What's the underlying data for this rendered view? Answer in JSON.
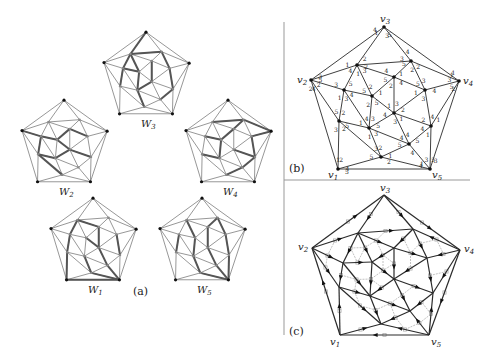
{
  "figure": {
    "panel_a": {
      "caption": "(a)",
      "graphs": [
        {
          "id": "W3",
          "label": "W",
          "sub": "3",
          "cx": 146,
          "cy": 81,
          "highlight": [
            [
              "v3",
              "a"
            ],
            [
              "a",
              "c"
            ],
            [
              "c",
              "h"
            ],
            [
              "a",
              "b"
            ],
            [
              "b",
              "e"
            ],
            [
              "e",
              "i"
            ],
            [
              "i",
              "k"
            ],
            [
              "c",
              "f"
            ],
            [
              "f",
              "j"
            ],
            [
              "a",
              "f"
            ],
            [
              "d",
              "g"
            ],
            [
              "g",
              "j"
            ],
            [
              "j",
              "l"
            ]
          ]
        },
        {
          "id": "W2",
          "label": "W",
          "sub": "2",
          "cx": 64,
          "cy": 149,
          "highlight": [
            [
              "v2",
              "c"
            ],
            [
              "c",
              "f"
            ],
            [
              "f",
              "d"
            ],
            [
              "d",
              "e"
            ],
            [
              "h",
              "j"
            ],
            [
              "j",
              "g"
            ],
            [
              "g",
              "i"
            ],
            [
              "c",
              "h"
            ],
            [
              "f",
              "g"
            ],
            [
              "h",
              "l"
            ]
          ]
        },
        {
          "id": "W4",
          "label": "W",
          "sub": "4",
          "cx": 228,
          "cy": 149,
          "highlight": [
            [
              "a",
              "b"
            ],
            [
              "b",
              "v4"
            ],
            [
              "v4",
              "e"
            ],
            [
              "e",
              "i"
            ],
            [
              "i",
              "k"
            ],
            [
              "k",
              "l"
            ],
            [
              "c",
              "f"
            ],
            [
              "f",
              "j"
            ],
            [
              "j",
              "h"
            ],
            [
              "f",
              "d"
            ],
            [
              "d",
              "b"
            ],
            [
              "g",
              "i"
            ]
          ]
        },
        {
          "id": "W1",
          "label": "W",
          "sub": "1",
          "cx": 93,
          "cy": 247,
          "highlight": [
            [
              "v1",
              "v5"
            ],
            [
              "v1",
              "h"
            ],
            [
              "h",
              "c"
            ],
            [
              "c",
              "a"
            ],
            [
              "a",
              "d"
            ],
            [
              "d",
              "g"
            ],
            [
              "g",
              "k"
            ],
            [
              "k",
              "v5"
            ],
            [
              "f",
              "g"
            ],
            [
              "j",
              "l"
            ],
            [
              "l",
              "v5"
            ],
            [
              "e",
              "i"
            ]
          ]
        },
        {
          "id": "W5",
          "label": "W",
          "sub": "5",
          "cx": 202,
          "cy": 247,
          "highlight": [
            [
              "v5",
              "l"
            ],
            [
              "l",
              "j"
            ],
            [
              "j",
              "f"
            ],
            [
              "f",
              "a"
            ],
            [
              "v5",
              "k"
            ],
            [
              "k",
              "g"
            ],
            [
              "g",
              "d"
            ],
            [
              "d",
              "b"
            ],
            [
              "v5",
              "i"
            ],
            [
              "i",
              "e"
            ],
            [
              "e",
              "b"
            ],
            [
              "h",
              "c"
            ]
          ]
        }
      ]
    },
    "panel_b": {
      "caption": "(b)",
      "vertex_labels": {
        "v1": "v1",
        "v2": "v2",
        "v3": "v3",
        "v4": "v4",
        "v5": "v5"
      },
      "edge_label_values": [
        "1",
        "2",
        "3",
        "4",
        "5"
      ]
    },
    "panel_c": {
      "caption": "(c)",
      "vertex_labels": {
        "v1": "v1",
        "v2": "v2",
        "v3": "v3",
        "v4": "v4",
        "v5": "v5"
      }
    },
    "graph": {
      "vertices_b": {
        "v1": [
          338,
          169
        ],
        "v2": [
          311,
          80
        ],
        "v3": [
          384,
          27
        ],
        "v4": [
          459,
          81
        ],
        "v5": [
          430,
          169
        ],
        "a": [
          357,
          65
        ],
        "b": [
          411,
          61
        ],
        "c": [
          344,
          90
        ],
        "d": [
          394,
          77
        ],
        "e": [
          425,
          90
        ],
        "f": [
          372,
          96
        ],
        "g": [
          394,
          113
        ],
        "h": [
          339,
          121
        ],
        "i": [
          431,
          126
        ],
        "j": [
          369,
          128
        ],
        "k": [
          409,
          144
        ],
        "l": [
          381,
          157
        ]
      },
      "vertices_c": {
        "v1": [
          340,
          335
        ],
        "v2": [
          312,
          248
        ],
        "v3": [
          384,
          195
        ],
        "v4": [
          460,
          250
        ],
        "v5": [
          429,
          335
        ],
        "a": [
          358,
          233
        ],
        "b": [
          413,
          229
        ],
        "c": [
          343,
          263
        ],
        "d": [
          394,
          248
        ],
        "e": [
          427,
          258
        ],
        "f": [
          372,
          262
        ],
        "g": [
          394,
          279
        ],
        "h": [
          339,
          287
        ],
        "i": [
          433,
          293
        ],
        "j": [
          370,
          296
        ],
        "k": [
          410,
          311
        ],
        "l": [
          381,
          324
        ]
      },
      "edges": [
        [
          "v1",
          "v2"
        ],
        [
          "v2",
          "v3"
        ],
        [
          "v3",
          "v4"
        ],
        [
          "v4",
          "v5"
        ],
        [
          "v5",
          "v1"
        ],
        [
          "v3",
          "a"
        ],
        [
          "v3",
          "b"
        ],
        [
          "v2",
          "a"
        ],
        [
          "v2",
          "c"
        ],
        [
          "v2",
          "h"
        ],
        [
          "v4",
          "b"
        ],
        [
          "v4",
          "e"
        ],
        [
          "v4",
          "i"
        ],
        [
          "v1",
          "h"
        ],
        [
          "v1",
          "l"
        ],
        [
          "v5",
          "l"
        ],
        [
          "v5",
          "k"
        ],
        [
          "v5",
          "i"
        ],
        [
          "a",
          "b"
        ],
        [
          "a",
          "c"
        ],
        [
          "a",
          "f"
        ],
        [
          "a",
          "d"
        ],
        [
          "b",
          "d"
        ],
        [
          "b",
          "e"
        ],
        [
          "c",
          "f"
        ],
        [
          "c",
          "h"
        ],
        [
          "c",
          "j"
        ],
        [
          "d",
          "f"
        ],
        [
          "d",
          "g"
        ],
        [
          "d",
          "e"
        ],
        [
          "e",
          "g"
        ],
        [
          "e",
          "i"
        ],
        [
          "f",
          "g"
        ],
        [
          "f",
          "j"
        ],
        [
          "g",
          "j"
        ],
        [
          "g",
          "i"
        ],
        [
          "g",
          "k"
        ],
        [
          "h",
          "j"
        ],
        [
          "h",
          "l"
        ],
        [
          "i",
          "k"
        ],
        [
          "j",
          "l"
        ],
        [
          "j",
          "k"
        ],
        [
          "k",
          "l"
        ]
      ]
    },
    "colors": {
      "edge": "#2a2a2a",
      "gray_edge": "#8a8a8a",
      "highlight": "#555555",
      "dual": "#a8a8a8",
      "divider": "#888888"
    }
  }
}
